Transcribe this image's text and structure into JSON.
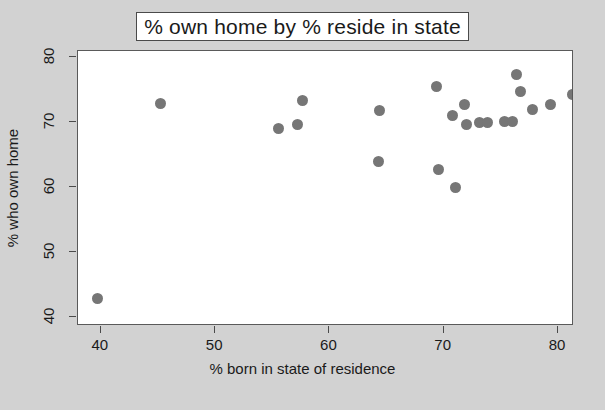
{
  "chart_data": {
    "type": "scatter",
    "title": "% own home by % reside in state",
    "xlabel": "% born in state of residence",
    "ylabel": "% who own home",
    "xlim": [
      38.0,
      81.4
    ],
    "ylim": [
      38.6,
      81.0
    ],
    "xticks": [
      40,
      50,
      60,
      70,
      80
    ],
    "yticks": [
      40,
      50,
      60,
      70,
      80
    ],
    "grid": false,
    "legend": null,
    "marker": {
      "shape": "circle",
      "color": "#767676",
      "size": 11
    },
    "points": [
      {
        "x": 39.7,
        "y": 42.8
      },
      {
        "x": 45.2,
        "y": 72.9
      },
      {
        "x": 55.5,
        "y": 69.1
      },
      {
        "x": 57.2,
        "y": 69.6
      },
      {
        "x": 57.6,
        "y": 73.4
      },
      {
        "x": 64.3,
        "y": 64.0
      },
      {
        "x": 64.4,
        "y": 71.9
      },
      {
        "x": 69.4,
        "y": 75.6
      },
      {
        "x": 69.5,
        "y": 62.8
      },
      {
        "x": 70.8,
        "y": 71.1
      },
      {
        "x": 71.0,
        "y": 60.0
      },
      {
        "x": 71.8,
        "y": 72.7
      },
      {
        "x": 72.0,
        "y": 69.6
      },
      {
        "x": 73.1,
        "y": 69.9
      },
      {
        "x": 73.8,
        "y": 69.9
      },
      {
        "x": 75.3,
        "y": 70.2
      },
      {
        "x": 76.0,
        "y": 70.2
      },
      {
        "x": 76.4,
        "y": 77.3
      },
      {
        "x": 76.7,
        "y": 74.7
      },
      {
        "x": 77.8,
        "y": 72.0
      },
      {
        "x": 79.3,
        "y": 72.8
      },
      {
        "x": 81.3,
        "y": 74.3
      }
    ]
  },
  "axes": {
    "x_title": "% born in state of residence",
    "y_title": "% who own home",
    "x_tick_labels": [
      "40",
      "50",
      "60",
      "70",
      "80"
    ],
    "y_tick_labels": [
      "40",
      "50",
      "60",
      "70",
      "80"
    ]
  },
  "colors": {
    "figure_background": "#d2d2d2",
    "panel_background": "#ffffff",
    "marker": "#767676",
    "axis": "#4a4a4a",
    "text": "#1a1a1a"
  }
}
